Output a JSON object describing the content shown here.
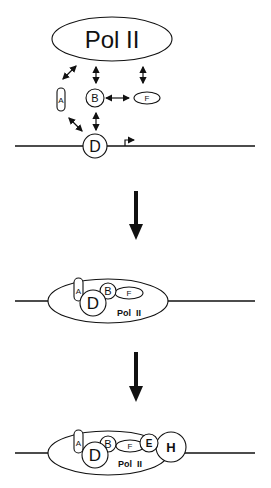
{
  "stage1": {
    "pol_label": "Pol II",
    "factors": {
      "a": "A",
      "b": "B",
      "f": "F",
      "d": "D"
    }
  },
  "stage2": {
    "pol_label": "Pol  II",
    "factors": {
      "a": "A",
      "b": "B",
      "f": "F",
      "d": "D"
    }
  },
  "stage3": {
    "pol_label": "Pol  II",
    "factors": {
      "a": "A",
      "b": "B",
      "f": "F",
      "d": "D",
      "e": "E",
      "h": "H"
    }
  },
  "colors": {
    "ink": "#111111",
    "background": "#ffffff"
  }
}
